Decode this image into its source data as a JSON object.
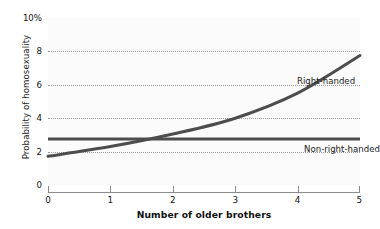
{
  "chart_data": {
    "type": "line",
    "title": "",
    "xlabel": "Number of older brothers",
    "ylabel": "Probability of homosexuality",
    "xlim": [
      0,
      5
    ],
    "ylim": [
      0,
      10
    ],
    "grid": true,
    "grid_axis": "y",
    "legend_position": "inline-annotation",
    "x_ticks": [
      "0",
      "1",
      "2",
      "3",
      "4",
      "5"
    ],
    "y_ticks": [
      "0",
      "2",
      "4",
      "6",
      "8",
      "10%"
    ],
    "y_tick_values": [
      0,
      2,
      4,
      6,
      8,
      10
    ],
    "y_gridline_values": [
      2,
      4,
      6,
      8
    ],
    "x": [
      0,
      1,
      2,
      3,
      4,
      5
    ],
    "series": [
      {
        "name": "Right-handed",
        "values": [
          1.72,
          2.3,
          3.05,
          4.0,
          5.5,
          7.75
        ],
        "color": "#4d4d4d",
        "style": "curve"
      },
      {
        "name": "Non-right-handed",
        "values": [
          2.75,
          2.75,
          2.75,
          2.75,
          2.75,
          2.75
        ],
        "color": "#4d4d4d",
        "style": "flat"
      }
    ],
    "annotations": [
      {
        "text": "Right-handed",
        "x": 3.2,
        "y": 7.4
      },
      {
        "text": "Non-right-handed",
        "x": 3.3,
        "y": 3.6
      }
    ]
  },
  "axes": {
    "y_title": "Probability of homosexuality",
    "x_title": "Number of older brothers",
    "y_labels": {
      "t0": "0",
      "t2": "2",
      "t4": "4",
      "t6": "6",
      "t8": "8",
      "t10": "10%"
    },
    "x_labels": {
      "t0": "0",
      "t1": "1",
      "t2": "2",
      "t3": "3",
      "t4": "4",
      "t5": "5"
    }
  },
  "labels": {
    "right_handed": "Right-handed",
    "non_right_handed": "Non-right-handed"
  },
  "colors": {
    "line": "#4d4d4d",
    "axis": "#8c8c8c",
    "grid": "#9a9a9a",
    "plot_background": "#fbfbfb",
    "page_background": "#ffffff",
    "text": "#141414"
  }
}
